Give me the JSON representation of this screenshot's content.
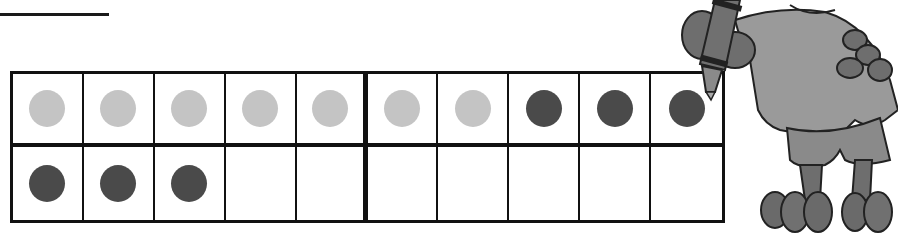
{
  "worksheet": {
    "answer_blank": "",
    "ten_frame": {
      "columns": 10,
      "rows": 2,
      "filled_count": 13,
      "light_counters": 7,
      "dark_counters": 6,
      "colors": {
        "light": "#c4c4c4",
        "dark": "#4a4a4a",
        "grid": "#111111"
      },
      "cells": [
        {
          "row": 0,
          "col": 0,
          "counter": "light"
        },
        {
          "row": 0,
          "col": 1,
          "counter": "light"
        },
        {
          "row": 0,
          "col": 2,
          "counter": "light"
        },
        {
          "row": 0,
          "col": 3,
          "counter": "light"
        },
        {
          "row": 0,
          "col": 4,
          "counter": "light"
        },
        {
          "row": 0,
          "col": 5,
          "counter": "light"
        },
        {
          "row": 0,
          "col": 6,
          "counter": "light"
        },
        {
          "row": 0,
          "col": 7,
          "counter": "dark"
        },
        {
          "row": 0,
          "col": 8,
          "counter": "dark"
        },
        {
          "row": 0,
          "col": 9,
          "counter": "dark"
        },
        {
          "row": 1,
          "col": 0,
          "counter": "dark"
        },
        {
          "row": 1,
          "col": 1,
          "counter": "dark"
        },
        {
          "row": 1,
          "col": 2,
          "counter": "dark"
        },
        {
          "row": 1,
          "col": 3,
          "counter": "empty"
        },
        {
          "row": 1,
          "col": 4,
          "counter": "empty"
        },
        {
          "row": 1,
          "col": 5,
          "counter": "empty"
        },
        {
          "row": 1,
          "col": 6,
          "counter": "empty"
        },
        {
          "row": 1,
          "col": 7,
          "counter": "empty"
        },
        {
          "row": 1,
          "col": 8,
          "counter": "empty"
        },
        {
          "row": 1,
          "col": 9,
          "counter": "empty"
        }
      ]
    },
    "mascot": {
      "icon": "cartoon-character-with-marker-icon"
    }
  }
}
